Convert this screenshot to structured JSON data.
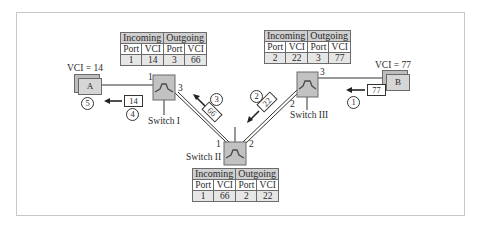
{
  "diagram": {
    "endpoints": [
      {
        "id": "A",
        "label": "A",
        "vci_label": "VCI = 14"
      },
      {
        "id": "B",
        "label": "B",
        "vci_label": "VCI = 77"
      }
    ],
    "switches": [
      {
        "id": "switch-1",
        "name": "Switch I",
        "ports": [
          "1",
          "3"
        ],
        "table": {
          "group_headers": [
            "Incoming",
            "Outgoing"
          ],
          "columns": [
            "Port",
            "VCI",
            "Port",
            "VCI"
          ],
          "rows": [
            [
              "1",
              "14",
              "3",
              "66"
            ]
          ]
        }
      },
      {
        "id": "switch-2",
        "name": "Switch II",
        "ports": [
          "1",
          "2"
        ],
        "table": {
          "group_headers": [
            "Incoming",
            "Outgoing"
          ],
          "columns": [
            "Port",
            "VCI",
            "Port",
            "VCI"
          ],
          "rows": [
            [
              "1",
              "66",
              "2",
              "22"
            ]
          ]
        }
      },
      {
        "id": "switch-3",
        "name": "Switch III",
        "ports": [
          "2",
          "3"
        ],
        "table": {
          "group_headers": [
            "Incoming",
            "Outgoing"
          ],
          "columns": [
            "Port",
            "VCI",
            "Port",
            "VCI"
          ],
          "rows": [
            [
              "2",
              "22",
              "3",
              "77"
            ]
          ]
        }
      }
    ],
    "frames": [
      {
        "step": "1",
        "vci": "77"
      },
      {
        "step": "2",
        "vci": "22"
      },
      {
        "step": "3",
        "vci": "66"
      },
      {
        "step": "4",
        "vci": "14"
      },
      {
        "step": "5",
        "vci": ""
      }
    ],
    "colors": {
      "switch_fill": "#c2c2c2",
      "table_header": "#cfcfcf",
      "line": "#333333"
    }
  }
}
